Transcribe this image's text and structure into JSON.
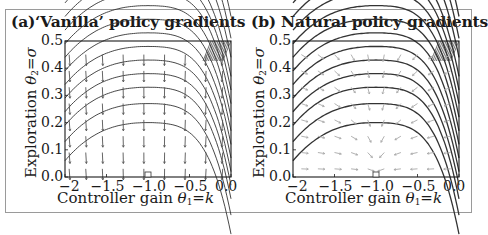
{
  "figure": {
    "panels": [
      {
        "id": "a",
        "title": "(a)‘Vanilla’ policy gradients",
        "xlabel_text": "Controller gain ",
        "xlabel_math": "θ",
        "xlabel_sub": "1",
        "xlabel_eq": "=",
        "xlabel_var": "k",
        "ylabel_text": "Exploration ",
        "ylabel_math": "θ",
        "ylabel_sub": "2",
        "ylabel_eq": "=",
        "ylabel_var": "σ"
      },
      {
        "id": "b",
        "title": "(b) Natural policy gradients",
        "xlabel_text": "Controller gain ",
        "xlabel_math": "θ",
        "xlabel_sub": "1",
        "xlabel_eq": "=",
        "xlabel_var": "k",
        "ylabel_text": "Exploration ",
        "ylabel_math": "θ",
        "ylabel_sub": "2",
        "ylabel_eq": "=",
        "ylabel_var": "σ"
      }
    ],
    "xticks": [
      "−2",
      "−1.5",
      "−1.0",
      "−0.5",
      "0.0"
    ],
    "yticks": [
      "0.5",
      "0.4",
      "0.3",
      "0.2",
      "0.1",
      "0.0"
    ],
    "colors": {
      "contour": "#333333",
      "vanilla_arrow": "#555555",
      "natural_arrow": "#a8a8a8",
      "frame": "#9a9a9a"
    }
  },
  "chart_data": [
    {
      "type": "contour+quiver",
      "title": "(a)‘Vanilla’ policy gradients",
      "xlabel": "Controller gain θ1=k",
      "ylabel": "Exploration θ2=σ",
      "xlim": [
        -2,
        0
      ],
      "ylim": [
        0,
        0.5
      ],
      "xticks": [
        -2,
        -1.5,
        -1.0,
        -0.5,
        0.0
      ],
      "yticks": [
        0.0,
        0.1,
        0.2,
        0.3,
        0.4,
        0.5
      ],
      "optimum_marker": {
        "k": -1.0,
        "sigma": 0.0,
        "shape": "square"
      },
      "contour_description": "Arched level sets of expected return centered near k=-1; contour peaks at approx sigma 0.2, 0.27, 0.33, 0.38, 0.43, 0.48; lines dense near k=0 and upper-left corner",
      "arrow_field": "Gradient arrows point almost straight down (toward sigma=0), slight tilt toward k=-1 near edges",
      "grid": false
    },
    {
      "type": "contour+quiver",
      "title": "(b) Natural policy gradients",
      "xlabel": "Controller gain θ1=k",
      "ylabel": "Exploration θ2=σ",
      "xlim": [
        -2,
        0
      ],
      "ylim": [
        0,
        0.5
      ],
      "xticks": [
        -2,
        -1.5,
        -1.0,
        -0.5,
        0.0
      ],
      "yticks": [
        0.0,
        0.1,
        0.2,
        0.3,
        0.4,
        0.5
      ],
      "optimum_marker": {
        "k": -1.0,
        "sigma": 0.0,
        "shape": "square"
      },
      "contour_description": "Same arched level sets as panel (a), drawn darker",
      "arrow_field": "Natural gradient arrows converge toward optimum at k=-1, sigma=0; near bottom arrows are nearly horizontal pointing toward k=-1",
      "grid": false
    }
  ]
}
